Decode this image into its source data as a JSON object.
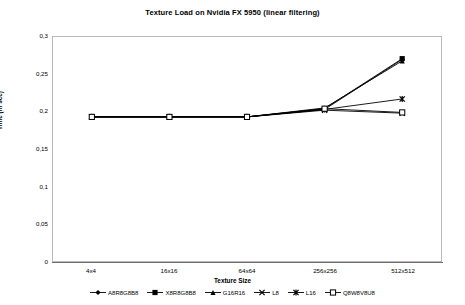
{
  "chart_data": {
    "type": "line",
    "title": "Texture Load on Nvidia FX 5950 (linear filtering)",
    "xlabel": "Texture Size",
    "ylabel": "Time (in sec)",
    "categories": [
      "4x4",
      "16x16",
      "64x64",
      "256x256",
      "512x512"
    ],
    "ylim": [
      0,
      0.3
    ],
    "ytick_labels": [
      "0,3",
      "0,25",
      "0,2",
      "0,15",
      "0,1",
      "0,05",
      "0"
    ],
    "ytick_values": [
      0.3,
      0.25,
      0.2,
      0.15,
      0.1,
      0.05,
      0
    ],
    "grid": false,
    "legend_position": "bottom",
    "decimal_separator": ",",
    "series": [
      {
        "name": "A8R8G8B8",
        "marker": "diamond",
        "color": "#000000",
        "values": [
          0.193,
          0.193,
          0.193,
          0.203,
          0.27
        ]
      },
      {
        "name": "X8R8G8B8",
        "marker": "square",
        "color": "#000000",
        "values": [
          0.193,
          0.193,
          0.193,
          0.204,
          0.271
        ]
      },
      {
        "name": "G16R16",
        "marker": "triangle",
        "color": "#000000",
        "values": [
          0.193,
          0.193,
          0.193,
          0.205,
          0.268
        ]
      },
      {
        "name": "L8",
        "marker": "cross",
        "color": "#000000",
        "values": [
          0.193,
          0.193,
          0.193,
          0.202,
          0.198
        ]
      },
      {
        "name": "L16",
        "marker": "star",
        "color": "#000000",
        "values": [
          0.193,
          0.193,
          0.193,
          0.203,
          0.217
        ]
      },
      {
        "name": "Q8W8V8U8",
        "marker": "open-square",
        "color": "#000000",
        "values": [
          0.193,
          0.193,
          0.193,
          0.204,
          0.199
        ]
      }
    ]
  }
}
